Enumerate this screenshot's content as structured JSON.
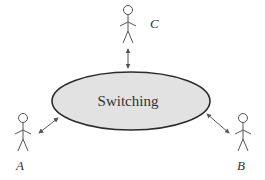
{
  "diagram": {
    "center": {
      "label": "Switching",
      "shape": "ellipse",
      "cx": 131,
      "cy": 101,
      "rx": 79,
      "ry": 29,
      "fill": "#e2e2e2",
      "stroke": "#2b2b2b"
    },
    "nodes": [
      {
        "id": "A",
        "label": "A",
        "icon": "person-icon",
        "head": [
          23,
          118
        ],
        "label_pos": [
          19,
          168
        ]
      },
      {
        "id": "B",
        "label": "B",
        "icon": "person-icon",
        "head": [
          243,
          118
        ],
        "label_pos": [
          239,
          168
        ]
      },
      {
        "id": "C",
        "label": "C",
        "icon": "person-icon",
        "head": [
          128,
          10
        ],
        "label_pos": [
          150,
          28
        ]
      }
    ],
    "links": [
      {
        "from": "A",
        "to": "Switching",
        "type": "bidirectional-arrow"
      },
      {
        "from": "B",
        "to": "Switching",
        "type": "bidirectional-arrow"
      },
      {
        "from": "C",
        "to": "Switching",
        "type": "bidirectional-arrow"
      }
    ]
  }
}
